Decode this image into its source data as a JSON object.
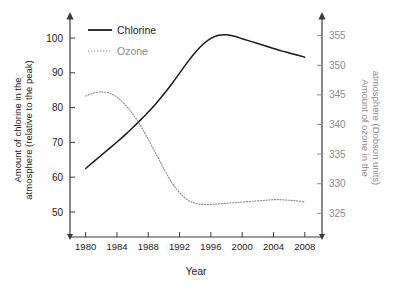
{
  "chart_data": {
    "type": "line",
    "title": "",
    "subtitle": "",
    "xlabel": "Year",
    "ylabel": "Amount of chlorine in the atmosphere (relative to the peak)",
    "y2label": "Amount of ozone in the atmosphere (Dobson units)",
    "xlim": [
      1978,
      2010
    ],
    "xticks": [
      1980,
      1984,
      1988,
      1992,
      1996,
      2000,
      2004,
      2008
    ],
    "xticklabels": [
      "1980",
      "1984",
      "1988",
      "1992",
      "1996",
      "2000",
      "2004",
      "2008"
    ],
    "ylim": [
      45,
      105
    ],
    "yticks": [
      50,
      60,
      70,
      80,
      90,
      100
    ],
    "yticklabels": [
      "50",
      "60",
      "70",
      "80",
      "90",
      "100"
    ],
    "y2lim": [
      322.5,
      357.5
    ],
    "y2ticks": [
      325,
      330,
      335,
      340,
      345,
      350,
      355
    ],
    "y2ticklabels": [
      "325",
      "330",
      "335",
      "340",
      "345",
      "350",
      "355"
    ],
    "grid": false,
    "legend_position": "top-left",
    "colors": {
      "chlorine": "#1a1a1a",
      "ozone": "#8c8c8c",
      "axis": "#3a3a3a",
      "axis_right": "#8c8c8c",
      "background": "#ffffff"
    },
    "series": [
      {
        "name": "Chlorine",
        "axis": "left",
        "style": "solid",
        "color": "#1a1a1a",
        "x": [
          1980,
          1981,
          1982,
          1983,
          1984,
          1985,
          1986,
          1987,
          1988,
          1989,
          1990,
          1991,
          1992,
          1993,
          1994,
          1995,
          1996,
          1997,
          1998,
          1999,
          2000,
          2001,
          2002,
          2003,
          2004,
          2005,
          2006,
          2007,
          2008
        ],
        "values": [
          62.5,
          64.4,
          66.3,
          68.2,
          70.1,
          72.1,
          74.2,
          76.4,
          78.7,
          81.2,
          83.9,
          86.8,
          89.9,
          93.0,
          95.8,
          98.2,
          99.9,
          100.8,
          100.9,
          100.5,
          99.8,
          99.1,
          98.4,
          97.7,
          97.0,
          96.3,
          95.7,
          95.1,
          94.5
        ]
      },
      {
        "name": "Ozone",
        "axis": "right",
        "style": "dotted",
        "color": "#8c8c8c",
        "x": [
          1980,
          1981,
          1982,
          1983,
          1984,
          1985,
          1986,
          1987,
          1988,
          1989,
          1990,
          1991,
          1992,
          1993,
          1994,
          1995,
          1996,
          1997,
          1998,
          1999,
          2000,
          2001,
          2002,
          2003,
          2004,
          2005,
          2006,
          2007,
          2008
        ],
        "values": [
          344.8,
          345.3,
          345.5,
          345.3,
          344.6,
          343.4,
          341.8,
          339.8,
          337.5,
          335.0,
          332.5,
          330.2,
          328.5,
          327.3,
          326.7,
          326.5,
          326.5,
          326.6,
          326.7,
          326.8,
          326.9,
          327.0,
          327.1,
          327.2,
          327.3,
          327.3,
          327.2,
          327.1,
          326.9
        ]
      }
    ]
  },
  "legend": {
    "items": [
      {
        "label": "Chlorine",
        "style": "solid",
        "color": "#1a1a1a"
      },
      {
        "label": "Ozone",
        "style": "dotted",
        "color": "#8c8c8c"
      }
    ]
  },
  "axes": {
    "left_title": "Amount of chlorine in the atmosphere (relative to the peak)",
    "left_title_line1": "Amount of chlorine in the",
    "left_title_line2": "atmosphere (relative to the peak)",
    "right_title_line1": "Amount of ozone in the",
    "right_title_line2": "atmosphere (Dobson units)",
    "x_title": "Year"
  }
}
